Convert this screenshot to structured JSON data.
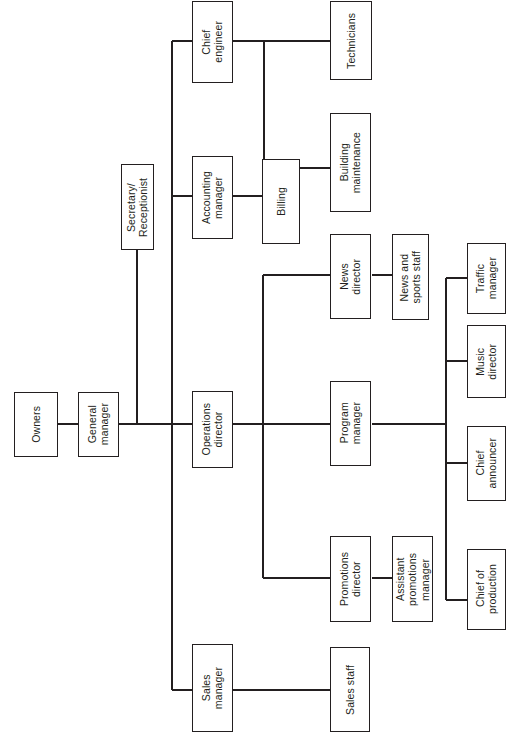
{
  "chart": {
    "orientation": "rotated-90-counterclockwise",
    "line_color": "#231f20",
    "box_fill": "#ffffff",
    "background": "#ffffff"
  },
  "nodes": {
    "owners": {
      "label": "Owners"
    },
    "general_manager": {
      "label": "General\nmanager"
    },
    "secretary_receptionist": {
      "label": "Secretary/\nReceptionist"
    },
    "chief_engineer": {
      "label": "Chief\nengineer"
    },
    "technicians": {
      "label": "Technicians"
    },
    "building_maintenance": {
      "label": "Building\nmaintenance"
    },
    "accounting_manager": {
      "label": "Accounting\nmanager"
    },
    "billing": {
      "label": "Billing"
    },
    "operations_director": {
      "label": "Operations\ndirector"
    },
    "news_director": {
      "label": "News\ndirector"
    },
    "news_and_sports_staff": {
      "label": "News and\nsports staff"
    },
    "program_manager": {
      "label": "Program\nmanager"
    },
    "traffic_manager": {
      "label": "Traffic\nmanager"
    },
    "music_director": {
      "label": "Music\ndirector"
    },
    "chief_announcer": {
      "label": "Chief\nannouncer"
    },
    "chief_of_production": {
      "label": "Chief of\nproduction"
    },
    "promotions_director": {
      "label": "Promotions\ndirector"
    },
    "assistant_promotions_manager": {
      "label": "Assistant\npromotions\nmanager"
    },
    "sales_manager": {
      "label": "Sales\nmanager"
    },
    "sales_staff": {
      "label": "Sales staff"
    }
  },
  "hierarchy": [
    {
      "parent": "owners",
      "child": "general_manager"
    },
    {
      "parent": "general_manager",
      "child": "secretary_receptionist"
    },
    {
      "parent": "general_manager",
      "child": "chief_engineer"
    },
    {
      "parent": "general_manager",
      "child": "accounting_manager"
    },
    {
      "parent": "general_manager",
      "child": "operations_director"
    },
    {
      "parent": "general_manager",
      "child": "sales_manager"
    },
    {
      "parent": "chief_engineer",
      "child": "technicians"
    },
    {
      "parent": "chief_engineer",
      "child": "building_maintenance"
    },
    {
      "parent": "accounting_manager",
      "child": "billing"
    },
    {
      "parent": "operations_director",
      "child": "news_director"
    },
    {
      "parent": "operations_director",
      "child": "program_manager"
    },
    {
      "parent": "operations_director",
      "child": "promotions_director"
    },
    {
      "parent": "news_director",
      "child": "news_and_sports_staff"
    },
    {
      "parent": "program_manager",
      "child": "traffic_manager"
    },
    {
      "parent": "program_manager",
      "child": "music_director"
    },
    {
      "parent": "program_manager",
      "child": "chief_announcer"
    },
    {
      "parent": "program_manager",
      "child": "chief_of_production"
    },
    {
      "parent": "promotions_director",
      "child": "assistant_promotions_manager"
    },
    {
      "parent": "sales_manager",
      "child": "sales_staff"
    }
  ]
}
